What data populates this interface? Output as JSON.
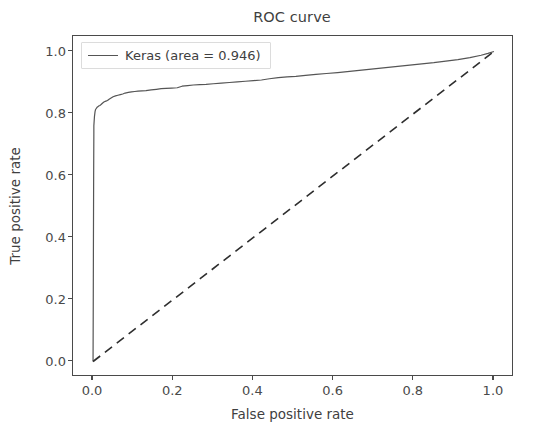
{
  "chart_data": {
    "type": "line",
    "title": "ROC curve",
    "xlabel": "False positive rate",
    "ylabel": "True positive rate",
    "xlim": [
      -0.05,
      1.05
    ],
    "ylim": [
      -0.05,
      1.05
    ],
    "xticks": [
      "0.0",
      "0.2",
      "0.4",
      "0.6",
      "0.8",
      "1.0"
    ],
    "xtick_values": [
      0.0,
      0.2,
      0.4,
      0.6,
      0.8,
      1.0
    ],
    "yticks": [
      "0.0",
      "0.2",
      "0.4",
      "0.6",
      "0.8",
      "1.0"
    ],
    "ytick_values": [
      0.0,
      0.2,
      0.4,
      0.6,
      0.8,
      1.0
    ],
    "grid": false,
    "legend_position": "upper left",
    "legend_entries": [
      {
        "label": "Keras (area = 0.946)",
        "color": "#555555",
        "linestyle": "solid"
      }
    ],
    "series": [
      {
        "name": "Keras (area = 0.946)",
        "auc": 0.946,
        "color": "#555555",
        "linestyle": "solid",
        "linewidth": 1.2,
        "x": [
          0.0,
          0.0005,
          0.001,
          0.0015,
          0.002,
          0.002,
          0.0035,
          0.005,
          0.006,
          0.008,
          0.01,
          0.012,
          0.014,
          0.017,
          0.02,
          0.024,
          0.028,
          0.032,
          0.036,
          0.04,
          0.045,
          0.05,
          0.056,
          0.062,
          0.068,
          0.074,
          0.08,
          0.088,
          0.096,
          0.104,
          0.112,
          0.122,
          0.132,
          0.145,
          0.158,
          0.17,
          0.182,
          0.196,
          0.21,
          0.222,
          0.236,
          0.25,
          0.266,
          0.282,
          0.3,
          0.32,
          0.34,
          0.36,
          0.38,
          0.4,
          0.42,
          0.44,
          0.462,
          0.484,
          0.506,
          0.53,
          0.556,
          0.582,
          0.61,
          0.64,
          0.67,
          0.7,
          0.73,
          0.76,
          0.79,
          0.82,
          0.85,
          0.88,
          0.91,
          0.94,
          0.968,
          0.985,
          1.0
        ],
        "y": [
          0.0,
          0.18,
          0.4,
          0.6,
          0.735,
          0.76,
          0.79,
          0.806,
          0.812,
          0.816,
          0.82,
          0.822,
          0.824,
          0.826,
          0.829,
          0.834,
          0.838,
          0.84,
          0.842,
          0.846,
          0.85,
          0.854,
          0.857,
          0.859,
          0.861,
          0.863,
          0.866,
          0.868,
          0.87,
          0.871,
          0.872,
          0.873,
          0.874,
          0.876,
          0.878,
          0.88,
          0.881,
          0.882,
          0.883,
          0.888,
          0.89,
          0.892,
          0.893,
          0.894,
          0.896,
          0.898,
          0.9,
          0.902,
          0.904,
          0.906,
          0.908,
          0.912,
          0.916,
          0.918,
          0.92,
          0.923,
          0.926,
          0.929,
          0.932,
          0.936,
          0.94,
          0.944,
          0.948,
          0.952,
          0.956,
          0.96,
          0.964,
          0.969,
          0.974,
          0.98,
          0.988,
          0.994,
          1.0
        ]
      },
      {
        "name": "chance-diagonal",
        "color": "#2e2e2e",
        "linestyle": "dashed",
        "linewidth": 1.6,
        "x": [
          0.0,
          1.0
        ],
        "y": [
          0.0,
          1.0
        ]
      }
    ]
  }
}
